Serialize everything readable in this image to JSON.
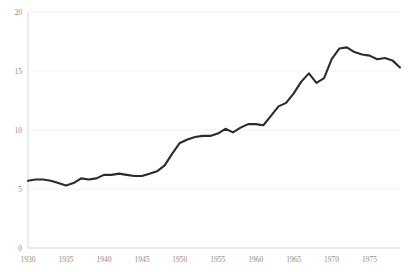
{
  "chart_data": {
    "type": "line",
    "title": "",
    "subtitle": "",
    "xlabel": "",
    "ylabel": "",
    "xlim": [
      1930,
      1979
    ],
    "ylim": [
      0,
      20
    ],
    "grid": true,
    "legend_position": "none",
    "series_color": "#2b2b2b",
    "yticks": [
      0,
      5,
      10,
      15,
      20
    ],
    "ytick_labels": [
      "0",
      "5",
      "10",
      "15",
      "20"
    ],
    "xticks": [
      1930,
      1935,
      1940,
      1945,
      1950,
      1955,
      1960,
      1965,
      1970,
      1975
    ],
    "xtick_labels": [
      "1930",
      "1935",
      "1940",
      "1945",
      "1950",
      "1955",
      "1960",
      "1965",
      "1970",
      "1975"
    ],
    "x": [
      1930,
      1931,
      1932,
      1933,
      1934,
      1935,
      1936,
      1937,
      1938,
      1939,
      1940,
      1941,
      1942,
      1943,
      1944,
      1945,
      1946,
      1947,
      1948,
      1949,
      1950,
      1951,
      1952,
      1953,
      1954,
      1955,
      1956,
      1957,
      1958,
      1959,
      1960,
      1961,
      1962,
      1963,
      1964,
      1965,
      1966,
      1967,
      1968,
      1969,
      1970,
      1971,
      1972,
      1973,
      1974,
      1975,
      1976,
      1977,
      1978,
      1979
    ],
    "series": [
      {
        "name": "value",
        "values": [
          5.7,
          5.8,
          5.8,
          5.7,
          5.5,
          5.3,
          5.5,
          5.9,
          5.8,
          5.9,
          6.2,
          6.2,
          6.3,
          6.2,
          6.1,
          6.1,
          6.3,
          6.5,
          7.0,
          8.0,
          8.9,
          9.2,
          9.4,
          9.5,
          9.5,
          9.7,
          10.1,
          9.8,
          10.2,
          10.5,
          10.5,
          10.4,
          11.2,
          12.0,
          12.3,
          13.1,
          14.1,
          14.8,
          14.0,
          14.4,
          16.0,
          16.9,
          17.0,
          16.6,
          16.4,
          16.3,
          16.0,
          16.1,
          15.9,
          15.3
        ]
      }
    ]
  },
  "axis": {
    "y_label_0": "0",
    "y_label_5": "5",
    "y_label_10": "10",
    "y_label_15": "15",
    "y_label_20": "20",
    "x_label_1930": "1930",
    "x_label_1935": "1935",
    "x_label_1940": "1940",
    "x_label_1945": "1945",
    "x_label_1950": "1950",
    "x_label_1955": "1955",
    "x_label_1960": "1960",
    "x_label_1965": "1965",
    "x_label_1970": "1970",
    "x_label_1975": "1975"
  }
}
